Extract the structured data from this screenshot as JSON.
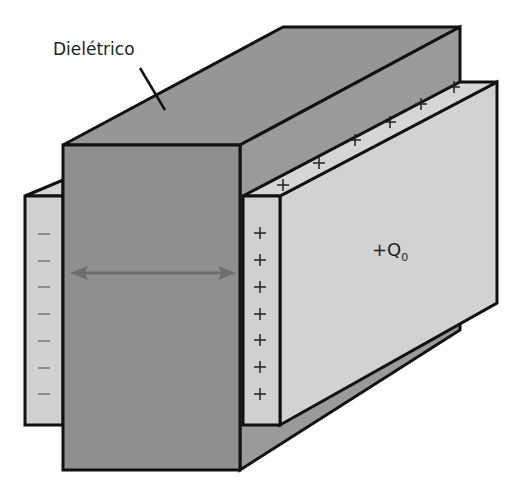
{
  "diagram": {
    "title_label": "Dielétrico",
    "charge_label": "+Q",
    "charge_subscript": "0",
    "positive_sign": "+",
    "negative_sign": "−",
    "colors": {
      "dielectric_front": "#8f8f8f",
      "dielectric_top": "#969696",
      "dielectric_side": "#9c9c9c",
      "plate": "#d0d0d0",
      "plate_top": "#d6d6d6",
      "outline": "#111111",
      "arrow": "#6e6e6e"
    },
    "left_plate_charges": 7,
    "right_plate_front_charges": 7,
    "right_plate_top_charges": 6
  }
}
